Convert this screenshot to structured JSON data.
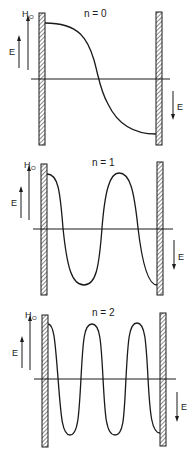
{
  "diagram": {
    "panels": [
      {
        "mode_label": "n = 0",
        "field_label": "H",
        "field_subscript": "O",
        "left_arrow_label": "E",
        "right_arrow_label": "E"
      },
      {
        "mode_label": "n = 1",
        "field_label": "H",
        "field_subscript": "O",
        "left_arrow_label": "E",
        "right_arrow_label": "E"
      },
      {
        "mode_label": "n = 2",
        "field_label": "H",
        "field_subscript": "O",
        "left_arrow_label": "E",
        "right_arrow_label": "E"
      }
    ],
    "colors": {
      "ink": "#1a1a1a",
      "background": "#ffffff"
    }
  }
}
